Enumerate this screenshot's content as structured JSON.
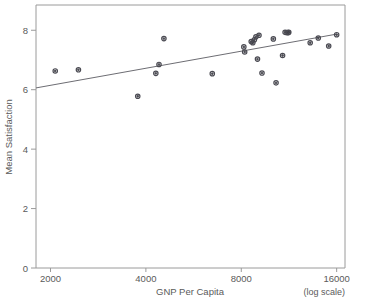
{
  "chart_data": {
    "type": "scatter",
    "title": "",
    "xlabel": "GNP Per Capita",
    "ylabel": "Mean Satisfaction",
    "x_scale": "log",
    "x_note": "(log scale)",
    "xticks": [
      2000,
      4000,
      8000,
      16000
    ],
    "xticklabels": [
      "2000",
      "4000",
      "8000",
      "16000"
    ],
    "yticks": [
      0,
      2,
      4,
      6,
      8
    ],
    "yticklabels": [
      "0",
      "2",
      "4",
      "6",
      "8"
    ],
    "xlim": [
      1800,
      17000
    ],
    "ylim": [
      0,
      8.85
    ],
    "grid": false,
    "legend": null,
    "series": [
      {
        "name": "Countries",
        "marker": "open-circle",
        "points": [
          {
            "x": 2070,
            "y": 6.63
          },
          {
            "x": 2450,
            "y": 6.67
          },
          {
            "x": 3770,
            "y": 5.78
          },
          {
            "x": 4300,
            "y": 6.55
          },
          {
            "x": 4400,
            "y": 6.85
          },
          {
            "x": 4560,
            "y": 7.72
          },
          {
            "x": 6480,
            "y": 6.54
          },
          {
            "x": 8150,
            "y": 7.44
          },
          {
            "x": 8200,
            "y": 7.27
          },
          {
            "x": 8600,
            "y": 7.62
          },
          {
            "x": 8700,
            "y": 7.58
          },
          {
            "x": 8800,
            "y": 7.68
          },
          {
            "x": 8900,
            "y": 7.78
          },
          {
            "x": 9000,
            "y": 7.03
          },
          {
            "x": 9100,
            "y": 7.83
          },
          {
            "x": 9300,
            "y": 6.56
          },
          {
            "x": 10100,
            "y": 7.71
          },
          {
            "x": 10300,
            "y": 6.23
          },
          {
            "x": 11000,
            "y": 7.93
          },
          {
            "x": 11150,
            "y": 7.92
          },
          {
            "x": 11250,
            "y": 7.92
          },
          {
            "x": 11300,
            "y": 7.93
          },
          {
            "x": 10800,
            "y": 7.15
          },
          {
            "x": 13200,
            "y": 7.58
          },
          {
            "x": 14000,
            "y": 7.74
          },
          {
            "x": 15100,
            "y": 7.47
          },
          {
            "x": 16000,
            "y": 7.85
          }
        ]
      }
    ],
    "fit_line": {
      "name": "regression-line",
      "x_start": 1800,
      "y_start": 6.06,
      "x_end": 16000,
      "y_end": 7.87
    }
  },
  "axes": {
    "y_axis_label": "Mean Satisfaction",
    "x_axis_label": "GNP Per Capita",
    "log_note": "(log scale)"
  }
}
